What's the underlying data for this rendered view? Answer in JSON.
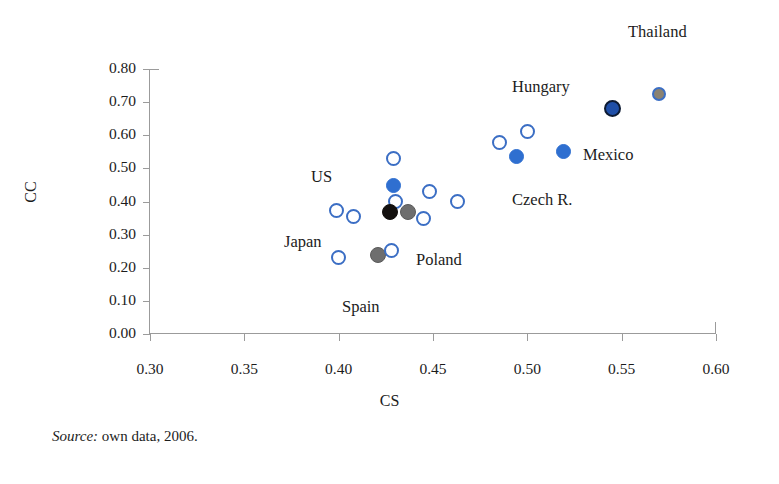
{
  "chart_data": {
    "type": "scatter",
    "title": "",
    "xlabel": "CS",
    "ylabel": "CC",
    "xlim": [
      0.3,
      0.6
    ],
    "ylim": [
      0.0,
      0.8
    ],
    "xticks": [
      "0.30",
      "0.35",
      "0.40",
      "0.45",
      "0.50",
      "0.55",
      "0.60"
    ],
    "yticks": [
      "0.00",
      "0.10",
      "0.20",
      "0.30",
      "0.40",
      "0.50",
      "0.60",
      "0.70",
      "0.80"
    ],
    "grid": false,
    "legend": "none",
    "source_note_prefix": "Source:",
    "source_note_text": "own data, 2006.",
    "points": [
      {
        "label": "",
        "x": 0.399,
        "y": 0.372,
        "style": "open"
      },
      {
        "label": "",
        "x": 0.408,
        "y": 0.355,
        "style": "open"
      },
      {
        "label": "",
        "x": 0.4,
        "y": 0.232,
        "style": "open"
      },
      {
        "label": "",
        "x": 0.429,
        "y": 0.53,
        "style": "open"
      },
      {
        "label": "",
        "x": 0.429,
        "y": 0.447,
        "style": "blue"
      },
      {
        "label": "",
        "x": 0.43,
        "y": 0.4,
        "style": "open"
      },
      {
        "label": "US",
        "x": 0.427,
        "y": 0.368,
        "style": "black"
      },
      {
        "label": "Poland",
        "x": 0.437,
        "y": 0.368,
        "style": "gray"
      },
      {
        "label": "",
        "x": 0.445,
        "y": 0.35,
        "style": "open"
      },
      {
        "label": "",
        "x": 0.448,
        "y": 0.43,
        "style": "open"
      },
      {
        "label": "",
        "x": 0.463,
        "y": 0.4,
        "style": "open"
      },
      {
        "label": "Japan",
        "x": 0.421,
        "y": 0.238,
        "style": "gray"
      },
      {
        "label": "",
        "x": 0.428,
        "y": 0.252,
        "style": "open"
      },
      {
        "label": "",
        "x": 0.485,
        "y": 0.578,
        "style": "open"
      },
      {
        "label": "",
        "x": 0.5,
        "y": 0.61,
        "style": "open"
      },
      {
        "label": "Czech R.",
        "x": 0.494,
        "y": 0.535,
        "style": "blue"
      },
      {
        "label": "Mexico",
        "x": 0.519,
        "y": 0.552,
        "style": "blue"
      },
      {
        "label": "Hungary",
        "x": 0.545,
        "y": 0.68,
        "style": "navy"
      },
      {
        "label": "Thailand",
        "x": 0.57,
        "y": 0.725,
        "style": "grayring"
      }
    ],
    "annotations": [
      {
        "name": "thailand",
        "text": "Thailand",
        "x": 628,
        "y": 22
      },
      {
        "name": "hungary",
        "text": "Hungary",
        "x": 512,
        "y": 77
      },
      {
        "name": "mexico",
        "text": "Mexico",
        "x": 583,
        "y": 145
      },
      {
        "name": "czech",
        "text": "Czech R.",
        "x": 512,
        "y": 190
      },
      {
        "name": "us",
        "text": "US",
        "x": 311,
        "y": 167
      },
      {
        "name": "japan",
        "text": "Japan",
        "x": 284,
        "y": 232
      },
      {
        "name": "poland",
        "text": "Poland",
        "x": 416,
        "y": 250
      },
      {
        "name": "spain",
        "text": "Spain",
        "x": 342,
        "y": 297
      }
    ],
    "colors": {
      "open_ring": "#3b6ec4",
      "blue_fill": "#2f6fd0",
      "navy_fill": "#1f4fa8",
      "black_fill": "#14110f",
      "gray_fill": "#6e6e6e",
      "gray_ring_fill": "#8a8272",
      "axis": "#9b9b9b",
      "text": "#1c1c1c"
    }
  }
}
